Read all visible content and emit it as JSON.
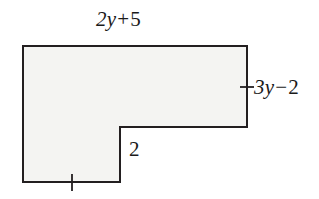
{
  "figure": {
    "type": "geometry-diagram",
    "shape_name": "L-shaped polygon",
    "fill_color": "#f4f4f2",
    "stroke_color": "#231f20",
    "background_color": "#ffffff",
    "stroke_width": 2,
    "outline_points": "23,46 247,46 247,127 120,127 120,182 23,182",
    "tick_marks": [
      {
        "name": "right-side-tick",
        "orientation": "horizontal",
        "x1": 240,
        "y1": 87,
        "x2": 254,
        "y2": 87
      },
      {
        "name": "bottom-side-tick",
        "orientation": "vertical",
        "x1": 72,
        "y1": 174,
        "x2": 72,
        "y2": 191
      }
    ]
  },
  "labels": {
    "top": {
      "text": "2y + 5",
      "coefficient": "2",
      "variable": "y",
      "operator": "+",
      "constant": "5"
    },
    "right": {
      "text": "3y − 2",
      "coefficient": "3",
      "variable": "y",
      "operator": "−",
      "constant": "2"
    },
    "notch": {
      "text": "2"
    }
  }
}
